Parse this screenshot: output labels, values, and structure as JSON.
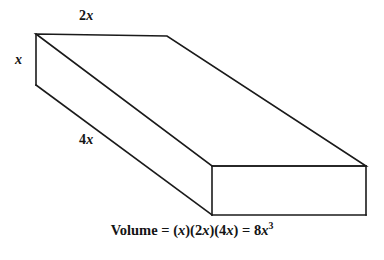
{
  "figure": {
    "type": "geometry-diagram",
    "shape_name": "rectangular-prism",
    "background_color": "#ffffff",
    "stroke_color": "#1a1a1a",
    "fill_color": "#ffffff"
  },
  "labels": {
    "width": {
      "prefix": "2",
      "variable": "x",
      "full_text": "2x",
      "edge": "top-back-edge"
    },
    "height": {
      "prefix": "",
      "variable": "x",
      "full_text": "x",
      "edge": "left-vertical-edge"
    },
    "length": {
      "prefix": "4",
      "variable": "x",
      "full_text": "4x",
      "edge": "left-side-long-edge"
    }
  },
  "caption": {
    "lead": "Volume = (",
    "v1": "x",
    "mid1": ")(2",
    "v2": "x",
    "mid2": ")(4",
    "v3": "x",
    "mid3": ") = 8",
    "v4": "x",
    "exponent": "3",
    "full_text": "Volume = (x)(2x)(4x) = 8x3"
  },
  "geometry": {
    "vertices": {
      "top_back_left": [
        36,
        34
      ],
      "top_back_right": [
        167,
        36
      ],
      "top_front_right": [
        366,
        166
      ],
      "top_front_left": [
        212,
        166
      ],
      "bottom_back_left": [
        36,
        85
      ],
      "bottom_front_left": [
        212,
        215
      ],
      "bottom_front_right": [
        366,
        215
      ]
    },
    "faces": {
      "top": "36,34 167,36 366,166 212,166",
      "front": "212,166 366,166 366,215 212,215",
      "left": "36,34 212,166 212,215 36,85"
    }
  }
}
